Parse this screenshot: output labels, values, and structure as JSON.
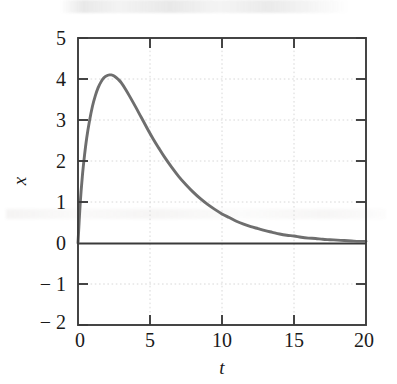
{
  "figure": {
    "background_color": "#ffffff",
    "frame_color": "#3c3c3c",
    "curve_color": "#6e6e6e",
    "grid_color": "#d8d8d8",
    "axis_line_color": "#3a3a3a",
    "text_color": "#1a1a1a"
  },
  "chart_data": {
    "type": "line",
    "title": "",
    "xlabel": "t",
    "ylabel": "x",
    "xlim": [
      0,
      20
    ],
    "ylim": [
      -2,
      5
    ],
    "grid": true,
    "legend": null,
    "xticks": [
      0,
      5,
      10,
      15,
      20
    ],
    "xticklabels": [
      "0",
      "5",
      "10",
      "15",
      "20"
    ],
    "yticks": [
      -2,
      -1,
      0,
      1,
      2,
      3,
      4,
      5
    ],
    "yticklabels": [
      "− 2",
      "− 1",
      "0",
      "1",
      "2",
      "3",
      "4",
      "5"
    ],
    "annotations": [
      "peak value approximately 4.1 at t approximately 2.3",
      "curve decays toward 0 as t increases",
      "curve starts at 0 when t equals 0"
    ],
    "series": [
      {
        "name": "x(t)",
        "x": [
          0.0,
          0.15,
          0.3,
          0.45,
          0.6,
          0.8,
          1.0,
          1.2,
          1.4,
          1.6,
          1.8,
          2.0,
          2.2,
          2.3,
          2.4,
          2.6,
          2.8,
          3.0,
          3.3,
          3.6,
          4.0,
          4.4,
          4.8,
          5.2,
          5.6,
          6.0,
          6.5,
          7.0,
          7.5,
          8.0,
          8.5,
          9.0,
          9.5,
          10.0,
          10.5,
          11.0,
          11.5,
          12.0,
          12.5,
          13.0,
          13.5,
          14.0,
          14.5,
          15.0,
          15.5,
          16.0,
          16.5,
          17.0,
          17.5,
          18.0,
          18.5,
          19.0,
          19.5,
          20.0
        ],
        "y": [
          0.0,
          0.95,
          1.62,
          2.13,
          2.55,
          2.98,
          3.33,
          3.59,
          3.79,
          3.93,
          4.03,
          4.08,
          4.1,
          4.1,
          4.09,
          4.05,
          3.99,
          3.91,
          3.75,
          3.57,
          3.32,
          3.06,
          2.8,
          2.55,
          2.32,
          2.1,
          1.85,
          1.62,
          1.42,
          1.24,
          1.08,
          0.94,
          0.82,
          0.71,
          0.62,
          0.53,
          0.46,
          0.4,
          0.35,
          0.3,
          0.26,
          0.22,
          0.19,
          0.17,
          0.14,
          0.12,
          0.11,
          0.09,
          0.08,
          0.07,
          0.06,
          0.05,
          0.04,
          0.04
        ]
      }
    ]
  }
}
